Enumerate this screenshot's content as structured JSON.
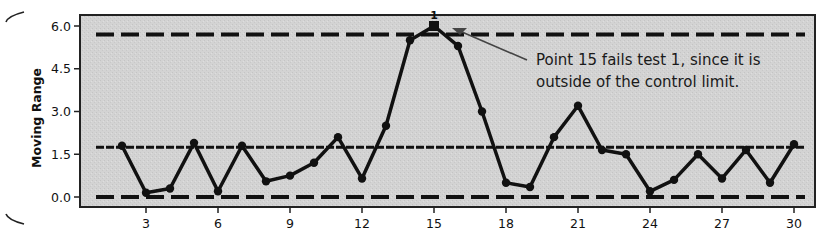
{
  "chart_data": {
    "type": "line",
    "title": "",
    "xlabel": "",
    "ylabel": "Moving Range",
    "x": [
      2,
      3,
      4,
      5,
      6,
      7,
      8,
      9,
      10,
      11,
      12,
      13,
      14,
      15,
      16,
      17,
      18,
      19,
      20,
      21,
      22,
      23,
      24,
      25,
      26,
      27,
      28,
      29,
      30
    ],
    "series": [
      {
        "name": "Moving Range",
        "values": [
          1.8,
          0.15,
          0.3,
          1.9,
          0.2,
          1.8,
          0.55,
          0.75,
          1.2,
          2.1,
          0.65,
          2.5,
          5.5,
          6.0,
          5.3,
          3.0,
          0.5,
          0.35,
          2.1,
          3.2,
          1.65,
          1.5,
          0.2,
          0.6,
          1.5,
          0.65,
          1.65,
          0.5,
          1.85
        ]
      }
    ],
    "reference_lines": [
      {
        "name": "UCL",
        "value": 5.7,
        "style": "long-dash"
      },
      {
        "name": "Center line (MR-bar)",
        "value": 1.75,
        "style": "short-dash"
      },
      {
        "name": "LCL",
        "value": 0.0,
        "style": "long-dash"
      }
    ],
    "flagged_points": [
      {
        "x": 15,
        "value": 6.0,
        "label": "1",
        "marker": "square"
      }
    ],
    "annotations": [
      {
        "text_lines": [
          "Point 15 fails test 1, since it is",
          "outside of the control limit."
        ],
        "points_to_x": 16
      }
    ],
    "xticks": [
      3,
      6,
      9,
      12,
      15,
      18,
      21,
      24,
      27,
      30
    ],
    "yticks": [
      "0.0",
      "1.5",
      "3.0",
      "4.5",
      "6.0"
    ],
    "ylim": [
      -0.35,
      6.4
    ],
    "xlim": [
      1,
      30.8
    ],
    "grid": false,
    "legend": null,
    "colors": {
      "plot_bg": "#d2d2d2",
      "line": "#111111",
      "frame": "#222222"
    }
  }
}
